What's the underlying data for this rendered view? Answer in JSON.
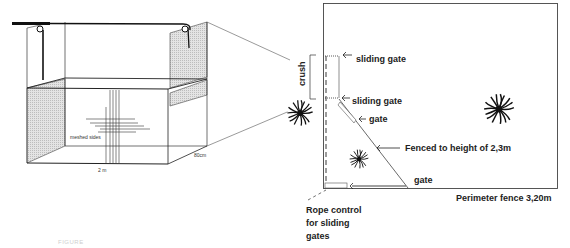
{
  "colors": {
    "line": "#222222",
    "thin_line": "#555555",
    "mesh_fill": "#d9d9d9",
    "background": "#ffffff"
  },
  "left_drawing": {
    "name": "crush box perspective",
    "labels": {
      "meshed_sides": "meshed sides",
      "width": "2 m",
      "depth": "80cm"
    },
    "icons": [
      "pulley-icon",
      "pulley-icon",
      "rope-bar-icon",
      "mesh-panel-icon"
    ]
  },
  "right_drawing": {
    "name": "enclosure plan view",
    "labels": {
      "crush": "crush",
      "sliding_gate_top": "sliding gate",
      "sliding_gate_bottom": "sliding gate",
      "gate_diagonal": "gate",
      "fenced": "Fenced to height of 2,3m",
      "gate_bottom": "gate",
      "perimeter": "Perimeter fence 3,20m",
      "rope_control_1": "Rope control",
      "rope_control_2": "for sliding",
      "rope_control_3": "gates"
    },
    "icons": [
      "tree-icon",
      "tree-icon",
      "tree-icon"
    ]
  },
  "caption": {
    "text": "FIGURE"
  }
}
